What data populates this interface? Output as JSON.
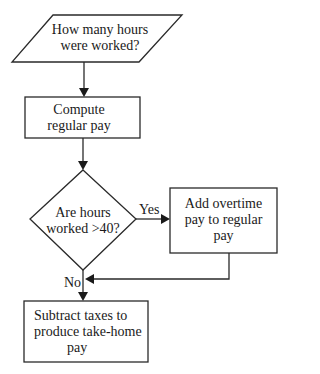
{
  "diagram": {
    "type": "flowchart",
    "nodes": [
      {
        "id": "input",
        "shape": "parallelogram",
        "lines": [
          "How many hours",
          "were worked?"
        ]
      },
      {
        "id": "compute",
        "shape": "rectangle",
        "lines": [
          "Compute",
          "regular pay"
        ]
      },
      {
        "id": "decision",
        "shape": "diamond",
        "lines": [
          "Are hours",
          "worked >40?"
        ]
      },
      {
        "id": "overtime",
        "shape": "rectangle",
        "lines": [
          "Add overtime",
          "pay to regular",
          "pay"
        ]
      },
      {
        "id": "taxes",
        "shape": "rectangle",
        "lines": [
          "Subtract taxes to",
          "produce take-home",
          "pay"
        ]
      }
    ],
    "edges": [
      {
        "from": "input",
        "to": "compute",
        "label": ""
      },
      {
        "from": "compute",
        "to": "decision",
        "label": ""
      },
      {
        "from": "decision",
        "to": "overtime",
        "label": "Yes"
      },
      {
        "from": "decision",
        "to": "taxes",
        "label": "No"
      },
      {
        "from": "overtime",
        "to": "taxes",
        "label": ""
      }
    ],
    "labels": {
      "yes": "Yes",
      "no": "No"
    },
    "colors": {
      "stroke": "#2a2a2a",
      "background": "#ffffff",
      "text": "#1a1a1a"
    }
  }
}
